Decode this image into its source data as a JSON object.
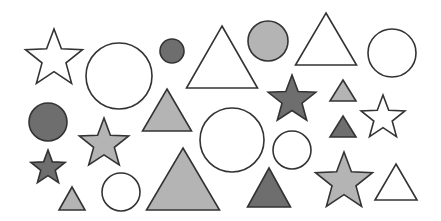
{
  "scene": {
    "title": "Geometric shapes arrangement",
    "colors": {
      "white": "#ffffff",
      "light": "#b4b4b4",
      "dark": "#6e6e6e",
      "stroke": "#333333",
      "background": "#ffffff"
    },
    "shape_counts": {
      "star": 6,
      "circle": 8,
      "triangle": 9
    },
    "shapes": [
      {
        "type": "star",
        "fill": "white"
      },
      {
        "type": "circle",
        "fill": "white"
      },
      {
        "type": "circle",
        "fill": "dark"
      },
      {
        "type": "triangle",
        "fill": "white"
      },
      {
        "type": "circle",
        "fill": "light"
      },
      {
        "type": "triangle",
        "fill": "white"
      },
      {
        "type": "circle",
        "fill": "white"
      },
      {
        "type": "circle",
        "fill": "dark"
      },
      {
        "type": "triangle",
        "fill": "light"
      },
      {
        "type": "star",
        "fill": "dark"
      },
      {
        "type": "triangle",
        "fill": "light"
      },
      {
        "type": "star",
        "fill": "white"
      },
      {
        "type": "star",
        "fill": "light"
      },
      {
        "type": "circle",
        "fill": "white"
      },
      {
        "type": "triangle",
        "fill": "dark"
      },
      {
        "type": "circle",
        "fill": "white"
      },
      {
        "type": "star",
        "fill": "dark"
      },
      {
        "type": "triangle",
        "fill": "light"
      },
      {
        "type": "triangle",
        "fill": "dark"
      },
      {
        "type": "star",
        "fill": "light"
      },
      {
        "type": "triangle",
        "fill": "white"
      },
      {
        "type": "triangle",
        "fill": "light"
      },
      {
        "type": "circle",
        "fill": "white"
      }
    ]
  }
}
